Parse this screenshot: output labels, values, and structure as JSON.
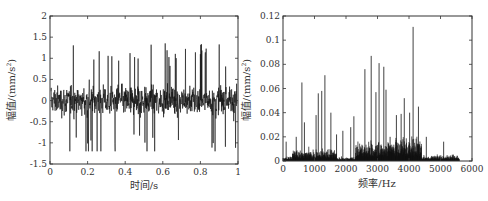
{
  "chart_data": [
    {
      "type": "line",
      "title": "",
      "xlabel": "时间/s",
      "ylabel": "幅值/(mm/s²)",
      "ylabel_parts": {
        "text": "幅值/(mm/s",
        "sup": "2",
        "close": ")"
      },
      "xlim": [
        0,
        1
      ],
      "ylim": [
        -1.5,
        2
      ],
      "xticks": [
        "0",
        "0.2",
        "0.4",
        "0.6",
        "0.8",
        "1"
      ],
      "yticks": [
        "-1.5",
        "-1",
        "-0.5",
        "0",
        "0.5",
        "1",
        "1.5",
        "2"
      ],
      "grid": false,
      "legend": null,
      "description": "Dense noisy time-domain vibration signal centered at 0, mostly within ±0.6 with peaks up to about 1.55 and troughs down to about -1.2",
      "series": [
        {
          "name": "vibration acceleration",
          "envelope_typical": [
            -0.6,
            0.6
          ],
          "max": 1.55,
          "min": -1.2
        }
      ]
    },
    {
      "type": "bar",
      "title": "",
      "xlabel": "频率/Hz",
      "ylabel": "幅值/(mm/s²)",
      "ylabel_parts": {
        "text": "幅值/(mm/s",
        "sup": "2",
        "close": ")"
      },
      "xlim": [
        0,
        6000
      ],
      "ylim": [
        0,
        0.12
      ],
      "xticks": [
        "0",
        "1000",
        "2000",
        "3000",
        "4000",
        "5000",
        "6000"
      ],
      "yticks": [
        "0",
        "0.02",
        "0.04",
        "0.06",
        "0.08",
        "0.1",
        "0.12"
      ],
      "grid": false,
      "legend": null,
      "description": "Amplitude spectrum with energy from ~0 to ~5500 Hz; clusters near 500-700 Hz, 1000-1600 Hz, 2400-3000 Hz and 3300-3800 Hz; highest peak about 0.111 near 3650 Hz",
      "peaks": [
        {
          "x": 100,
          "y": 0.016
        },
        {
          "x": 420,
          "y": 0.02
        },
        {
          "x": 600,
          "y": 0.065
        },
        {
          "x": 680,
          "y": 0.032
        },
        {
          "x": 1050,
          "y": 0.038
        },
        {
          "x": 1120,
          "y": 0.056
        },
        {
          "x": 1230,
          "y": 0.058
        },
        {
          "x": 1330,
          "y": 0.071
        },
        {
          "x": 1520,
          "y": 0.04
        },
        {
          "x": 1700,
          "y": 0.022
        },
        {
          "x": 1900,
          "y": 0.025
        },
        {
          "x": 2150,
          "y": 0.028
        },
        {
          "x": 2250,
          "y": 0.037
        },
        {
          "x": 2600,
          "y": 0.076
        },
        {
          "x": 2800,
          "y": 0.087
        },
        {
          "x": 2950,
          "y": 0.057
        },
        {
          "x": 3050,
          "y": 0.081
        },
        {
          "x": 3200,
          "y": 0.078
        },
        {
          "x": 3270,
          "y": 0.059
        },
        {
          "x": 3400,
          "y": 0.02
        },
        {
          "x": 3600,
          "y": 0.038
        },
        {
          "x": 3750,
          "y": 0.039
        },
        {
          "x": 3850,
          "y": 0.052
        },
        {
          "x": 4020,
          "y": 0.04
        },
        {
          "x": 4130,
          "y": 0.111
        },
        {
          "x": 4300,
          "y": 0.045
        },
        {
          "x": 4550,
          "y": 0.02
        },
        {
          "x": 5100,
          "y": 0.016
        },
        {
          "x": 5400,
          "y": 0.005
        }
      ]
    }
  ]
}
